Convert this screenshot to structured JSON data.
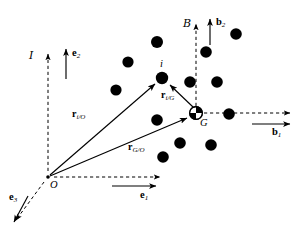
{
  "figure": {
    "type": "vector-kinematics-diagram",
    "width": 302,
    "height": 235,
    "background_color": "#ffffff",
    "ink_color": "#000000"
  },
  "frames": {
    "inertial": {
      "symbol": "I",
      "origin_label": "O",
      "origin_x": 48,
      "origin_y": 177
    },
    "body": {
      "symbol": "B",
      "origin_label": "G",
      "origin_x": 196,
      "origin_y": 113
    }
  },
  "labels": {
    "frame_inertial": "I",
    "frame_body": "B",
    "origin_O": "O",
    "center_of_mass_G": "G",
    "particle_i": "i",
    "basis_e1": "e",
    "basis_e1_sub": "1",
    "basis_e2": "e",
    "basis_e2_sub": "2",
    "basis_e3": "e",
    "basis_e3_sub": "3",
    "basis_b1": "b",
    "basis_b1_sub": "1",
    "basis_b2": "b",
    "basis_b2_sub": "2",
    "vector_r_iO": "r",
    "vector_r_iO_sub": "i/O",
    "vector_r_GO": "r",
    "vector_r_GO_sub": "G/O",
    "vector_r_iG": "r",
    "vector_r_iG_sub": "i/G"
  },
  "particles": [
    {
      "id": "p1",
      "x": 157,
      "y": 42,
      "r": 6.0
    },
    {
      "id": "p2",
      "x": 128,
      "y": 62,
      "r": 5.6
    },
    {
      "id": "p3",
      "x": 206,
      "y": 52,
      "r": 5.8
    },
    {
      "id": "p4",
      "x": 116,
      "y": 90,
      "r": 5.6
    },
    {
      "id": "i",
      "x": 162,
      "y": 78,
      "r": 6.2
    },
    {
      "id": "p5",
      "x": 190,
      "y": 82,
      "r": 5.8
    },
    {
      "id": "p6",
      "x": 217,
      "y": 82,
      "r": 5.8
    },
    {
      "id": "p7",
      "x": 157,
      "y": 120,
      "r": 5.8
    },
    {
      "id": "p8",
      "x": 229,
      "y": 114,
      "r": 5.8
    },
    {
      "id": "p9",
      "x": 180,
      "y": 143,
      "r": 5.8
    },
    {
      "id": "p10",
      "x": 211,
      "y": 145,
      "r": 5.8
    },
    {
      "id": "p11",
      "x": 163,
      "y": 157,
      "r": 5.8
    },
    {
      "id": "p12",
      "x": 236,
      "y": 34,
      "r": 5.8
    }
  ],
  "vectors": [
    {
      "name": "r_i/O",
      "from": "O",
      "to": "i",
      "x1": 50,
      "y1": 175,
      "x2": 157,
      "y2": 83,
      "style": "solid-arrow"
    },
    {
      "name": "r_G/O",
      "from": "O",
      "to": "G",
      "x1": 50,
      "y1": 176,
      "x2": 189,
      "y2": 117,
      "style": "solid-arrow"
    },
    {
      "name": "r_i/G",
      "from": "G",
      "to": "i",
      "x1": 192,
      "y1": 108,
      "x2": 168,
      "y2": 84,
      "style": "solid-arrow"
    }
  ],
  "axes": [
    {
      "name": "e1-dashed-axis",
      "x1": 54,
      "y1": 177,
      "x2": 162,
      "y2": 177,
      "style": "dashed"
    },
    {
      "name": "e2-dashed-axis",
      "x1": 48,
      "y1": 171,
      "x2": 48,
      "y2": 52,
      "style": "dashed"
    },
    {
      "name": "e3-dashed-axis",
      "x1": 44,
      "y1": 182,
      "x2": 15,
      "y2": 222,
      "style": "dashed"
    },
    {
      "name": "b1-dashed-axis",
      "x1": 203,
      "y1": 113,
      "x2": 288,
      "y2": 113,
      "style": "dashed"
    },
    {
      "name": "b2-dashed-axis",
      "x1": 196,
      "y1": 106,
      "x2": 196,
      "y2": 22,
      "style": "dashed"
    }
  ],
  "basis_arrows": [
    {
      "name": "e1",
      "x1": 110,
      "y1": 185,
      "x2": 157,
      "y2": 185,
      "direction": "right"
    },
    {
      "name": "e2",
      "x1": 66,
      "y1": 78,
      "x2": 66,
      "y2": 47,
      "direction": "up"
    },
    {
      "name": "e3",
      "x1": 27,
      "y1": 195,
      "x2": 13,
      "y2": 223,
      "direction": "down-left"
    },
    {
      "name": "b1",
      "x1": 250,
      "y1": 124,
      "x2": 288,
      "y2": 124,
      "direction": "right"
    },
    {
      "name": "b2",
      "x1": 210,
      "y1": 44,
      "x2": 210,
      "y2": 17,
      "direction": "up"
    }
  ]
}
